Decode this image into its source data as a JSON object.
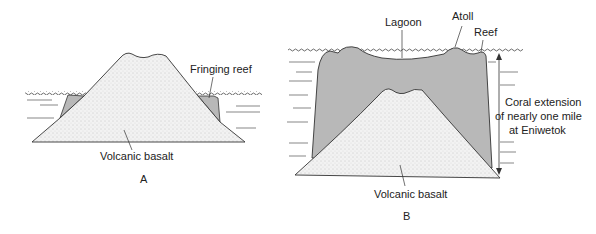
{
  "diagram_a": {
    "labels": {
      "fringing_reef": "Fringing reef",
      "basalt": "Volcanic basalt",
      "panel": "A"
    }
  },
  "diagram_b": {
    "labels": {
      "lagoon": "Lagoon",
      "atoll": "Atoll",
      "reef": "Reef",
      "coral_line1": "Coral extension",
      "coral_line2": "of nearly one mile",
      "coral_line3": "at Eniwetok",
      "basalt": "Volcanic basalt",
      "panel": "B"
    }
  },
  "colors": {
    "reef_fill": "#b8b8b8",
    "basalt_fill": "#eeeeee",
    "line": "#333333"
  }
}
